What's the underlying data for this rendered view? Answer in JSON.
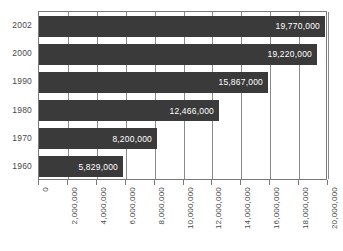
{
  "chart_data": {
    "type": "bar",
    "orientation": "horizontal",
    "title": "",
    "xlabel": "",
    "ylabel": "",
    "categories": [
      "2002",
      "2000",
      "1990",
      "1980",
      "1970",
      "1960"
    ],
    "values": [
      19770000,
      19220000,
      15867000,
      12466000,
      8200000,
      5829000
    ],
    "value_labels": [
      "19,770,000",
      "19,220,000",
      "15,867,000",
      "12,466,000",
      "8,200,000",
      "5,829,000"
    ],
    "xlim": [
      0,
      20000000
    ],
    "xticks": [
      0,
      2000000,
      4000000,
      6000000,
      8000000,
      10000000,
      12000000,
      14000000,
      16000000,
      18000000,
      20000000
    ],
    "xtick_labels": [
      "0",
      "2,000,000",
      "4,000,000",
      "6,000,000",
      "8,000,000",
      "10,000,000",
      "12,000,000",
      "14,000,000",
      "16,000,000",
      "18,000,000",
      "20,000,000"
    ],
    "xtick_rotation": 90,
    "grid": true,
    "grid_axis": "x",
    "legend": false,
    "bar_color": "#3a3a3a",
    "value_label_color": "#ffffff",
    "axis_color": "#7a7a7a",
    "grid_color": "#8a8a8a",
    "background_color": "#ffffff"
  }
}
